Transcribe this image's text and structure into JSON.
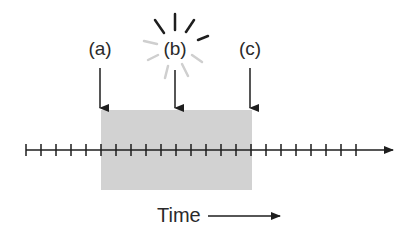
{
  "diagram": {
    "events": [
      {
        "id": "a",
        "label": "(a)",
        "x": 100
      },
      {
        "id": "b",
        "label": "(b)",
        "x": 175,
        "highlight": "flash"
      },
      {
        "id": "c",
        "label": "(c)",
        "x": 250
      }
    ],
    "timeline": {
      "y": 150,
      "x_start": 26,
      "x_end": 393,
      "tick_start": 26,
      "tick_spacing": 15,
      "tick_count": 23
    },
    "shaded_region": {
      "x_start": 101,
      "x_end": 252,
      "y_top": 110,
      "y_bottom": 190,
      "color": "#d2d2d2"
    },
    "axis_label": "Time",
    "colors": {
      "ink": "#2a2a2a",
      "flash_dark": "#1e1e1e",
      "flash_light": "#cfcfcf",
      "shade": "#d2d2d2"
    }
  }
}
